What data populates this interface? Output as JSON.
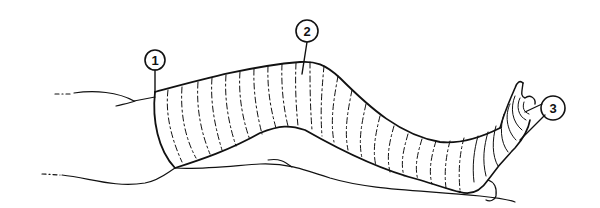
{
  "figure": {
    "callouts": [
      {
        "id": "1",
        "label": "1"
      },
      {
        "id": "2",
        "label": "2"
      },
      {
        "id": "3",
        "label": "3"
      }
    ],
    "colors": {
      "ink": "#111111",
      "background": "#ffffff"
    }
  }
}
